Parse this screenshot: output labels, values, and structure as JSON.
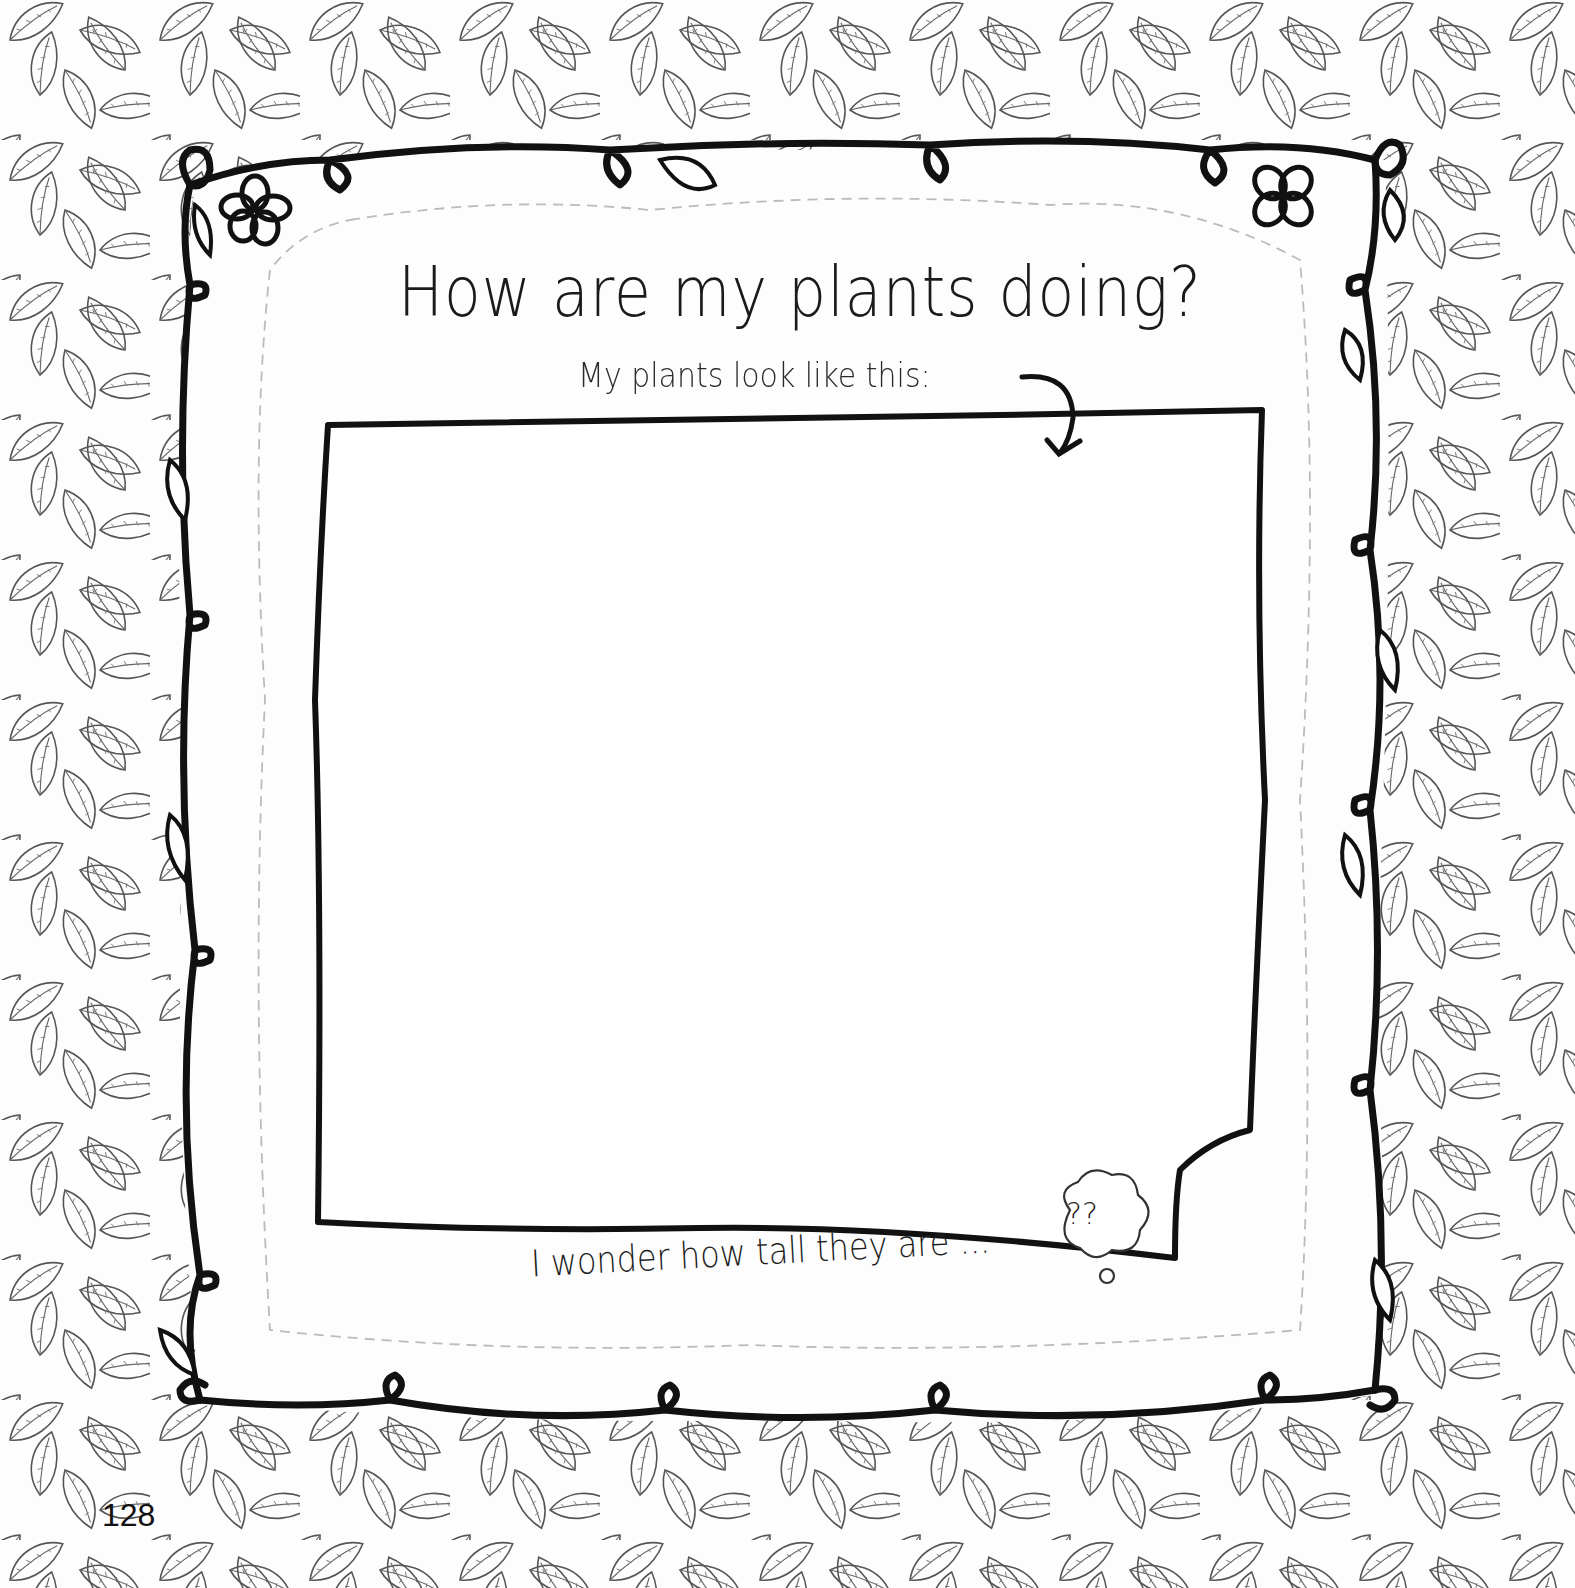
{
  "page": {
    "title": "How are my plants doing?",
    "subtitle": "My plants look like this:",
    "prompt": "I wonder how tall they are ...",
    "thought_bubble_text": "??",
    "page_number": "128"
  },
  "decorations": {
    "background_pattern": "leaf-pattern",
    "frame": "vine-frame-with-loops",
    "flowers": [
      "flower-top-left",
      "flower-top-right"
    ],
    "arrow": "curved-arrow-down",
    "cut_line": "dashed-outline"
  },
  "colors": {
    "ink": "#111111",
    "leaf_line": "#555555",
    "dashed_line": "#bbbbbb",
    "paper": "#fdfdfd"
  }
}
